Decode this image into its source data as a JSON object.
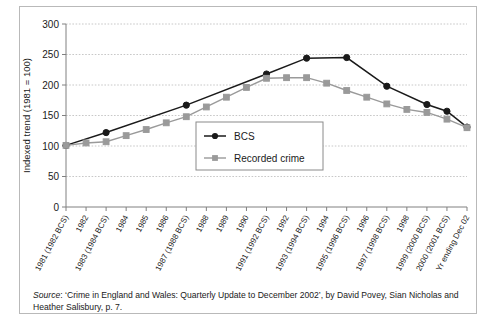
{
  "chart_data": {
    "type": "line",
    "title": "",
    "xlabel": "",
    "ylabel": "Indexed trend (1981 = 100)",
    "ylim": [
      0,
      300
    ],
    "yticks": [
      0,
      50,
      100,
      150,
      200,
      250,
      300
    ],
    "grid": true,
    "legend_position": "center-right-inside",
    "categories": [
      "1981 (1982 BCS)",
      "1982",
      "1983 (1984 BCS)",
      "1984",
      "1985",
      "1986",
      "1987 (1988 BCS)",
      "1988",
      "1989",
      "1990",
      "1991 (1992 BCS)",
      "1992",
      "1993 (1994 BCS)",
      "1994",
      "1995 (1996 BCS)",
      "1996",
      "1997 (1998 BCS)",
      "1998",
      "1999 (2000 BCS)",
      "2000 (2001 BCS)",
      "Yr ending Dec 02"
    ],
    "series": [
      {
        "name": "BCS",
        "color": "#1a1a1a",
        "marker": "circle",
        "values": [
          101,
          null,
          122,
          null,
          null,
          null,
          167,
          null,
          null,
          null,
          218,
          null,
          244,
          null,
          245,
          null,
          198,
          null,
          168,
          157,
          131
        ]
      },
      {
        "name": "Recorded crime",
        "color": "#9a9a9a",
        "marker": "square",
        "values": [
          101,
          105,
          107,
          117,
          127,
          138,
          148,
          164,
          180,
          196,
          211,
          212,
          212,
          203,
          191,
          180,
          169,
          160,
          155,
          144,
          130
        ]
      }
    ]
  },
  "legend": {
    "entries": [
      {
        "label": "BCS"
      },
      {
        "label": "Recorded crime"
      }
    ]
  },
  "source": {
    "prefix": "Source",
    "text": ": ‘Crime in England and Wales: Quarterly Update to December 2002’, by David Povey,  Sian Nicholas and Heather Salisbury, p. 7."
  }
}
